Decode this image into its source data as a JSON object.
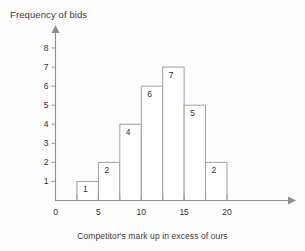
{
  "chart_data": {
    "type": "bar",
    "title": "",
    "subtitle": "",
    "xlabel": "Competitor's mark up in excess of ours",
    "ylabel": "Frequency of bids",
    "categories": [
      "2.5-5",
      "5-7.5",
      "7.5-10",
      "10-12.5",
      "12.5-15",
      "15-17.5",
      "17.5-20"
    ],
    "bin_edges": [
      2.5,
      5,
      7.5,
      10,
      12.5,
      15,
      17.5,
      20
    ],
    "values": [
      1,
      2,
      4,
      6,
      7,
      5,
      2
    ],
    "bar_labels": [
      "1",
      "2",
      "4",
      "6",
      "7",
      "5",
      "2"
    ],
    "xlim": [
      0,
      23
    ],
    "ylim": [
      0,
      8.8
    ],
    "x_tick_values": [
      0,
      5,
      10,
      15,
      20
    ],
    "x_tick_labels": [
      "0",
      "5",
      "10",
      "15",
      "20"
    ],
    "x_minor_tick_values": [
      2.5,
      7.5,
      12.5,
      17.5
    ],
    "y_tick_values": [
      1,
      2,
      3,
      4,
      5,
      6,
      7,
      8
    ],
    "y_tick_labels": [
      "1",
      "2",
      "3",
      "4",
      "5",
      "6",
      "7",
      "8"
    ],
    "grid": false,
    "legend": null,
    "legend_position": "none",
    "bar_fill_color": "#ffffff",
    "bar_stroke_color": "#a0a0a0",
    "axis_color": "#8e8e8e",
    "text_color": "#2e2e2e",
    "background_color": "#fdfdfd"
  },
  "axes": {
    "y_title": "Frequency of bids",
    "x_title": "Competitor's mark up in excess of ours"
  }
}
